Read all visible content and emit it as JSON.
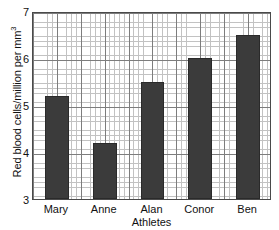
{
  "chart_data": {
    "type": "bar",
    "title": "",
    "categories": [
      "Mary",
      "Anne",
      "Alan",
      "Conor",
      "Ben"
    ],
    "values": [
      5.2,
      4.2,
      5.5,
      6.0,
      6.5
    ],
    "xlabel": "Athletes",
    "ylabel": "Red blood cells/million per mm",
    "ylabel_superscript": "3",
    "ylim": [
      3,
      7
    ],
    "ytick_labels": [
      "7",
      "6",
      "5",
      "4",
      "3"
    ],
    "ytick_values": [
      7,
      6,
      5,
      4,
      3
    ],
    "major_gridline_step": 0.5,
    "minor_gridline_step": 0.1,
    "grid": true,
    "legend": false,
    "bar_color": "#3b3b3b",
    "grid_major_color": "#7d7d7d",
    "grid_minor_color": "#c2c2c2",
    "axis_color": "#4a4a4a",
    "background_color": "#ffffff"
  }
}
